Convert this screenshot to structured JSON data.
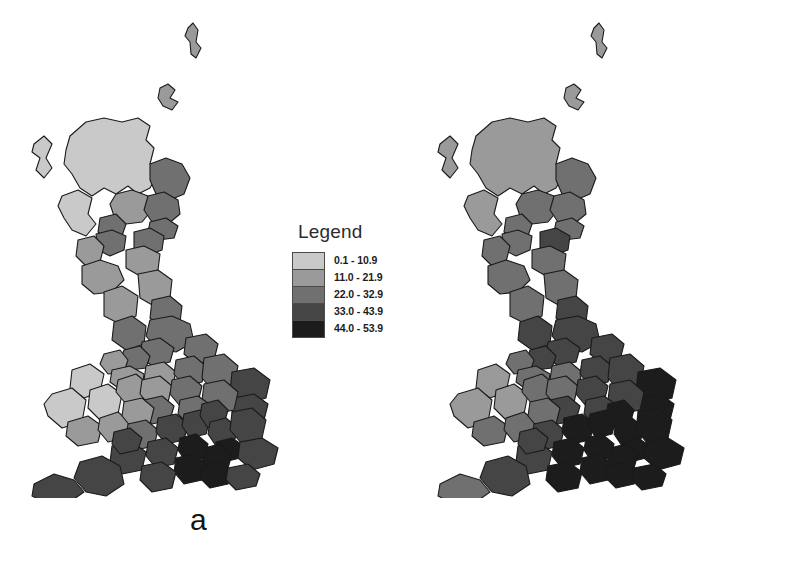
{
  "figure": {
    "background_color": "#ffffff"
  },
  "panels": [
    {
      "id": "a",
      "letter": "a",
      "legend": {
        "title": "Legend",
        "classes": [
          {
            "range": "0.1 - 10.9",
            "color": "#c9c9c9"
          },
          {
            "range": "11.0 - 21.9",
            "color": "#9a9a9a"
          },
          {
            "range": "22.0 - 32.9",
            "color": "#707070"
          },
          {
            "range": "33.0 - 43.9",
            "color": "#454545"
          },
          {
            "range": "44.0 - 53.9",
            "color": "#1c1c1c"
          }
        ]
      }
    },
    {
      "id": "b",
      "letter": "b",
      "legend": {
        "title": "Legend",
        "classes": [
          {
            "range": "0.1 - 10.9",
            "color": "#c9c9c9"
          },
          {
            "range": "11.0 - 21.9",
            "color": "#9a9a9a"
          },
          {
            "range": "22.0 - 32.9",
            "color": "#707070"
          },
          {
            "range": "33.0 - 43.9",
            "color": "#454545"
          },
          {
            "range": "44.0 - 53.9",
            "color": "#1c1c1c"
          }
        ]
      }
    }
  ],
  "chart_data": {
    "type": "map",
    "subtype": "choropleth",
    "region": "Great Britain",
    "title": "",
    "n_classes": 5,
    "class_breaks": [
      "0.1 - 10.9",
      "11.0 - 21.9",
      "22.0 - 32.9",
      "33.0 - 43.9",
      "44.0 - 53.9"
    ],
    "class_colors": [
      "#c9c9c9",
      "#9a9a9a",
      "#707070",
      "#454545",
      "#1c1c1c"
    ],
    "legend_position": "right",
    "panels": [
      {
        "label": "a",
        "areas": [
          {
            "name": "Shetland",
            "class": 2
          },
          {
            "name": "Orkney",
            "class": 2
          },
          {
            "name": "Highland",
            "class": 1
          },
          {
            "name": "Western Isles",
            "class": 1
          },
          {
            "name": "Moray / Aberdeenshire",
            "class": 3
          },
          {
            "name": "Perth & Kinross",
            "class": 2
          },
          {
            "name": "Angus / Tayside",
            "class": 3
          },
          {
            "name": "Argyll & Bute",
            "class": 1
          },
          {
            "name": "Stirling",
            "class": 3
          },
          {
            "name": "Fife",
            "class": 3
          },
          {
            "name": "Glasgow / Strathclyde",
            "class": 3
          },
          {
            "name": "Lothian",
            "class": 3
          },
          {
            "name": "Ayrshire",
            "class": 2
          },
          {
            "name": "Scottish Borders",
            "class": 2
          },
          {
            "name": "Dumfries & Galloway",
            "class": 2
          },
          {
            "name": "Northumberland",
            "class": 2
          },
          {
            "name": "Cumbria",
            "class": 2
          },
          {
            "name": "Tyne & Wear / Durham",
            "class": 3
          },
          {
            "name": "Lancashire",
            "class": 3
          },
          {
            "name": "North Yorkshire",
            "class": 3
          },
          {
            "name": "West Yorkshire",
            "class": 3
          },
          {
            "name": "Humberside",
            "class": 3
          },
          {
            "name": "Greater Manchester",
            "class": 3
          },
          {
            "name": "Merseyside",
            "class": 2
          },
          {
            "name": "Cheshire",
            "class": 2
          },
          {
            "name": "Derbyshire",
            "class": 2
          },
          {
            "name": "Nottinghamshire",
            "class": 3
          },
          {
            "name": "Lincolnshire",
            "class": 3
          },
          {
            "name": "Gwynedd / North Wales",
            "class": 1
          },
          {
            "name": "Powys",
            "class": 1
          },
          {
            "name": "Dyfed / West Wales",
            "class": 1
          },
          {
            "name": "Glamorgan",
            "class": 2
          },
          {
            "name": "Gwent",
            "class": 2
          },
          {
            "name": "Shropshire",
            "class": 2
          },
          {
            "name": "Staffordshire",
            "class": 2
          },
          {
            "name": "West Midlands",
            "class": 3
          },
          {
            "name": "Leicestershire",
            "class": 3
          },
          {
            "name": "Norfolk",
            "class": 4
          },
          {
            "name": "Suffolk",
            "class": 4
          },
          {
            "name": "Cambridgeshire",
            "class": 3
          },
          {
            "name": "Northamptonshire",
            "class": 3
          },
          {
            "name": "Hereford & Worcester",
            "class": 2
          },
          {
            "name": "Gloucestershire",
            "class": 3
          },
          {
            "name": "Oxfordshire",
            "class": 4
          },
          {
            "name": "Buckinghamshire",
            "class": 4
          },
          {
            "name": "Bedfordshire",
            "class": 4
          },
          {
            "name": "Hertfordshire",
            "class": 4
          },
          {
            "name": "Essex",
            "class": 4
          },
          {
            "name": "Greater London",
            "class": 5
          },
          {
            "name": "Kent",
            "class": 4
          },
          {
            "name": "Surrey",
            "class": 5
          },
          {
            "name": "Berkshire",
            "class": 5
          },
          {
            "name": "Wiltshire",
            "class": 4
          },
          {
            "name": "Hampshire",
            "class": 5
          },
          {
            "name": "West Sussex",
            "class": 5
          },
          {
            "name": "East Sussex",
            "class": 4
          },
          {
            "name": "Somerset",
            "class": 4
          },
          {
            "name": "Avon",
            "class": 4
          },
          {
            "name": "Dorset",
            "class": 4
          },
          {
            "name": "Devon",
            "class": 4
          },
          {
            "name": "Cornwall",
            "class": 4
          }
        ]
      },
      {
        "label": "b",
        "areas": [
          {
            "name": "Shetland",
            "class": 2
          },
          {
            "name": "Orkney",
            "class": 2
          },
          {
            "name": "Highland",
            "class": 2
          },
          {
            "name": "Western Isles",
            "class": 2
          },
          {
            "name": "Moray / Aberdeenshire",
            "class": 3
          },
          {
            "name": "Perth & Kinross",
            "class": 3
          },
          {
            "name": "Angus / Tayside",
            "class": 3
          },
          {
            "name": "Argyll & Bute",
            "class": 2
          },
          {
            "name": "Stirling",
            "class": 3
          },
          {
            "name": "Fife",
            "class": 3
          },
          {
            "name": "Glasgow / Strathclyde",
            "class": 3
          },
          {
            "name": "Lothian",
            "class": 4
          },
          {
            "name": "Ayrshire",
            "class": 3
          },
          {
            "name": "Scottish Borders",
            "class": 3
          },
          {
            "name": "Dumfries & Galloway",
            "class": 3
          },
          {
            "name": "Northumberland",
            "class": 3
          },
          {
            "name": "Cumbria",
            "class": 3
          },
          {
            "name": "Tyne & Wear / Durham",
            "class": 4
          },
          {
            "name": "Lancashire",
            "class": 4
          },
          {
            "name": "North Yorkshire",
            "class": 4
          },
          {
            "name": "West Yorkshire",
            "class": 4
          },
          {
            "name": "Humberside",
            "class": 4
          },
          {
            "name": "Greater Manchester",
            "class": 4
          },
          {
            "name": "Merseyside",
            "class": 3
          },
          {
            "name": "Cheshire",
            "class": 3
          },
          {
            "name": "Derbyshire",
            "class": 3
          },
          {
            "name": "Nottinghamshire",
            "class": 4
          },
          {
            "name": "Lincolnshire",
            "class": 4
          },
          {
            "name": "Gwynedd / North Wales",
            "class": 2
          },
          {
            "name": "Powys",
            "class": 2
          },
          {
            "name": "Dyfed / West Wales",
            "class": 2
          },
          {
            "name": "Glamorgan",
            "class": 3
          },
          {
            "name": "Gwent",
            "class": 3
          },
          {
            "name": "Shropshire",
            "class": 3
          },
          {
            "name": "Staffordshire",
            "class": 3
          },
          {
            "name": "West Midlands",
            "class": 4
          },
          {
            "name": "Leicestershire",
            "class": 4
          },
          {
            "name": "Norfolk",
            "class": 5
          },
          {
            "name": "Suffolk",
            "class": 5
          },
          {
            "name": "Cambridgeshire",
            "class": 4
          },
          {
            "name": "Northamptonshire",
            "class": 4
          },
          {
            "name": "Hereford & Worcester",
            "class": 3
          },
          {
            "name": "Gloucestershire",
            "class": 4
          },
          {
            "name": "Oxfordshire",
            "class": 5
          },
          {
            "name": "Buckinghamshire",
            "class": 5
          },
          {
            "name": "Bedfordshire",
            "class": 5
          },
          {
            "name": "Hertfordshire",
            "class": 5
          },
          {
            "name": "Essex",
            "class": 5
          },
          {
            "name": "Greater London",
            "class": 5
          },
          {
            "name": "Kent",
            "class": 5
          },
          {
            "name": "Surrey",
            "class": 5
          },
          {
            "name": "Berkshire",
            "class": 5
          },
          {
            "name": "Wiltshire",
            "class": 5
          },
          {
            "name": "Hampshire",
            "class": 5
          },
          {
            "name": "West Sussex",
            "class": 5
          },
          {
            "name": "East Sussex",
            "class": 5
          },
          {
            "name": "Somerset",
            "class": 4
          },
          {
            "name": "Avon",
            "class": 4
          },
          {
            "name": "Dorset",
            "class": 5
          },
          {
            "name": "Devon",
            "class": 4
          },
          {
            "name": "Cornwall",
            "class": 3
          }
        ]
      }
    ]
  }
}
